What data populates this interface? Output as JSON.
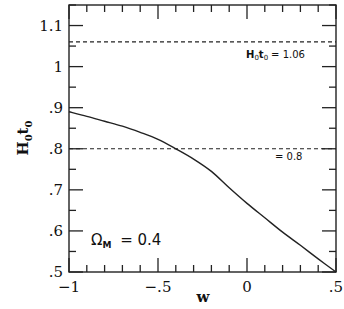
{
  "chart_data": {
    "type": "line",
    "title": "",
    "xlabel": "w",
    "ylabel": "H₀t₀",
    "ylabel_parts": {
      "base1": "H",
      "sub1": "0",
      "base2": "t",
      "sub2": "0"
    },
    "xlim": [
      -1,
      0.5
    ],
    "ylim": [
      0.5,
      1.15
    ],
    "x_ticks": [
      {
        "value": -1,
        "label": "−1"
      },
      {
        "value": -0.5,
        "label": "−.5"
      },
      {
        "value": 0,
        "label": "0"
      },
      {
        "value": 0.5,
        "label": ".5"
      }
    ],
    "x_minor_step": 0.1,
    "y_ticks": [
      {
        "value": 0.5,
        "label": ".5"
      },
      {
        "value": 0.6,
        "label": ".6"
      },
      {
        "value": 0.7,
        "label": ".7"
      },
      {
        "value": 0.8,
        "label": ".8"
      },
      {
        "value": 0.9,
        "label": ".9"
      },
      {
        "value": 1.0,
        "label": "1"
      },
      {
        "value": 1.1,
        "label": "1.1"
      }
    ],
    "y_minor_step": 0.05,
    "grid": false,
    "series": [
      {
        "name": "H0t0 vs w (Omega_M = 0.4)",
        "style": "solid",
        "x": [
          -1.0,
          -0.9,
          -0.8,
          -0.7,
          -0.6,
          -0.5,
          -0.4,
          -0.3,
          -0.2,
          -0.1,
          0.0,
          0.1,
          0.2,
          0.3,
          0.4,
          0.5
        ],
        "y": [
          0.89,
          0.879,
          0.867,
          0.855,
          0.84,
          0.823,
          0.8,
          0.775,
          0.745,
          0.705,
          0.667,
          0.632,
          0.597,
          0.565,
          0.532,
          0.5
        ]
      }
    ],
    "reference_lines": [
      {
        "name": "H0t0 = 1.06",
        "y": 1.06,
        "style": "dashed",
        "label": "= 1.06"
      },
      {
        "name": "H0t0 = 0.8",
        "y": 0.8,
        "style": "dashed",
        "label": "= 0.8"
      }
    ],
    "annotations": {
      "omega_label": {
        "base": "Ω",
        "sub": "M",
        "text": " = 0.4"
      },
      "ref1_prefix": {
        "base1": "H",
        "sub1": "0",
        "base2": "t",
        "sub2": "0"
      }
    }
  }
}
